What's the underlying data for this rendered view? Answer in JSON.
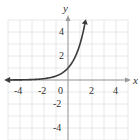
{
  "chart_data": {
    "type": "line",
    "title": "",
    "function": "y = 3^x",
    "xlabel": "x",
    "ylabel": "y",
    "xlim": [
      -5,
      5
    ],
    "ylim": [
      -5,
      5
    ],
    "grid": true,
    "x_ticks": [
      "-4",
      "-2",
      "0",
      "2",
      "4"
    ],
    "y_ticks": [
      "4",
      "2",
      "-2",
      "-4"
    ],
    "series": [
      {
        "name": "exponential curve",
        "x": [
          -5,
          -4,
          -3,
          -2,
          -1,
          -0.5,
          0,
          0.5,
          1,
          1.25,
          1.46
        ],
        "y": [
          0.004,
          0.012,
          0.037,
          0.111,
          0.333,
          0.577,
          1,
          1.732,
          3,
          3.948,
          4.97
        ]
      }
    ],
    "colors": {
      "curve": "#3a3a3a",
      "grid": "#e2e2e2",
      "axes": "#9a9a9a"
    }
  }
}
